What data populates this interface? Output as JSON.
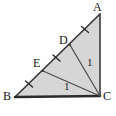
{
  "figure": {
    "type": "geometry-diagram",
    "canvas": {
      "width": 116,
      "height": 116
    },
    "background_color": "#fefefe",
    "fill_color": "#d4d4d4",
    "stroke_color": "#3a3a3a",
    "thick_stroke_color": "#2b2b2b",
    "label_color": "#1a1a1a",
    "vertices": [
      {
        "name": "A",
        "label": "A",
        "x": 100,
        "y": 14,
        "label_x": 93,
        "label_y": 1
      },
      {
        "name": "B",
        "label": "B",
        "x": 15,
        "y": 97,
        "label_x": 3,
        "label_y": 90
      },
      {
        "name": "C",
        "label": "C",
        "x": 100,
        "y": 96,
        "label_x": 103,
        "label_y": 90
      }
    ],
    "points_on_hypotenuse": [
      {
        "name": "D",
        "label": "D",
        "x": 70,
        "y": 45,
        "label_x": 59,
        "label_y": 34
      },
      {
        "name": "E",
        "label": "E",
        "x": 43,
        "y": 71,
        "label_x": 33,
        "label_y": 57
      }
    ],
    "segments": [
      {
        "name": "side-AB",
        "from": "A",
        "to": "B",
        "style": "thin"
      },
      {
        "name": "side-BC",
        "from": "B",
        "to": "C",
        "style": "thick"
      },
      {
        "name": "side-CA",
        "from": "C",
        "to": "A",
        "style": "thin"
      },
      {
        "name": "cevian-CD",
        "from": "C",
        "to": "D",
        "style": "thin"
      },
      {
        "name": "cevian-CE",
        "from": "C",
        "to": "E",
        "style": "thin"
      }
    ],
    "length_labels": [
      {
        "name": "length-cd",
        "text": "1",
        "x": 87,
        "y": 57,
        "for_segment": "cevian-CD"
      },
      {
        "name": "length-ce",
        "text": "1",
        "x": 64,
        "y": 81,
        "for_segment": "cevian-CE"
      }
    ],
    "tick_marks": [
      {
        "name": "tick-be",
        "on_segment": "B-E",
        "x": 29,
        "y": 84
      },
      {
        "name": "tick-ed",
        "on_segment": "E-D",
        "x": 56.5,
        "y": 58
      },
      {
        "name": "tick-da",
        "on_segment": "D-A",
        "x": 85,
        "y": 29.5
      }
    ]
  }
}
